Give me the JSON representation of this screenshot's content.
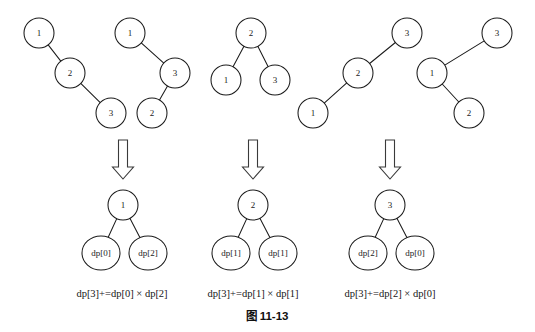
{
  "figure": {
    "caption": "图 11-13",
    "background_color": "#ffffff",
    "stroke_color": "#1b1b1b",
    "arrow_icon_name": "down-arrow-icon"
  },
  "top_trees": [
    {
      "id": "tree-1",
      "shape": "right-skewed-chain",
      "nodes": [
        {
          "label": "1",
          "cx": 39,
          "cy": 33,
          "r": 15
        },
        {
          "label": "2",
          "cx": 70,
          "cy": 73,
          "r": 15
        },
        {
          "label": "3",
          "cx": 111,
          "cy": 113,
          "r": 15
        }
      ],
      "edges": [
        [
          0,
          1
        ],
        [
          1,
          2
        ]
      ]
    },
    {
      "id": "tree-2",
      "shape": "zigzag-chain",
      "nodes": [
        {
          "label": "1",
          "cx": 130,
          "cy": 33,
          "r": 15
        },
        {
          "label": "3",
          "cx": 175,
          "cy": 73,
          "r": 15
        },
        {
          "label": "2",
          "cx": 152,
          "cy": 113,
          "r": 15
        }
      ],
      "edges": [
        [
          0,
          1
        ],
        [
          1,
          2
        ]
      ]
    },
    {
      "id": "tree-3",
      "shape": "balanced",
      "nodes": [
        {
          "label": "2",
          "cx": 251,
          "cy": 33,
          "r": 15
        },
        {
          "label": "1",
          "cx": 226,
          "cy": 80,
          "r": 15
        },
        {
          "label": "3",
          "cx": 275,
          "cy": 80,
          "r": 15
        }
      ],
      "edges": [
        [
          0,
          1
        ],
        [
          0,
          2
        ]
      ]
    },
    {
      "id": "tree-4",
      "shape": "left-skewed-chain",
      "nodes": [
        {
          "label": "3",
          "cx": 407,
          "cy": 33,
          "r": 15
        },
        {
          "label": "2",
          "cx": 358,
          "cy": 73,
          "r": 15
        },
        {
          "label": "1",
          "cx": 313,
          "cy": 113,
          "r": 15
        }
      ],
      "edges": [
        [
          0,
          1
        ],
        [
          1,
          2
        ]
      ]
    },
    {
      "id": "tree-5",
      "shape": "zigzag-chain",
      "nodes": [
        {
          "label": "3",
          "cx": 497,
          "cy": 33,
          "r": 15
        },
        {
          "label": "1",
          "cx": 432,
          "cy": 73,
          "r": 15
        },
        {
          "label": "2",
          "cx": 469,
          "cy": 113,
          "r": 15
        }
      ],
      "edges": [
        [
          0,
          1
        ],
        [
          1,
          2
        ]
      ]
    }
  ],
  "arrows": [
    {
      "id": "arrow-1",
      "x": 123,
      "top": 140,
      "bottom": 179
    },
    {
      "id": "arrow-2",
      "x": 253,
      "top": 140,
      "bottom": 179
    },
    {
      "id": "arrow-3",
      "x": 390,
      "top": 140,
      "bottom": 179
    }
  ],
  "result_groups": [
    {
      "id": "result-1",
      "root": {
        "label": "1",
        "cx": 123,
        "cy": 205,
        "r": 15
      },
      "children": [
        {
          "label": "dp[0]",
          "cx": 101,
          "cy": 253,
          "rx": 19,
          "ry": 17
        },
        {
          "label": "dp[2]",
          "cx": 148,
          "cy": 253,
          "rx": 19,
          "ry": 17
        }
      ],
      "formula": "dp[3]+=dp[0] × dp[2]",
      "formula_x": 122,
      "formula_y": 295
    },
    {
      "id": "result-2",
      "root": {
        "label": "2",
        "cx": 253,
        "cy": 205,
        "r": 15
      },
      "children": [
        {
          "label": "dp[1]",
          "cx": 231,
          "cy": 253,
          "rx": 19,
          "ry": 17
        },
        {
          "label": "dp[1]",
          "cx": 278,
          "cy": 253,
          "rx": 19,
          "ry": 17
        }
      ],
      "formula": "dp[3]+=dp[1] × dp[1]",
      "formula_x": 253,
      "formula_y": 295
    },
    {
      "id": "result-3",
      "root": {
        "label": "3",
        "cx": 390,
        "cy": 205,
        "r": 15
      },
      "children": [
        {
          "label": "dp[2]",
          "cx": 368,
          "cy": 253,
          "rx": 19,
          "ry": 17
        },
        {
          "label": "dp[0]",
          "cx": 415,
          "cy": 253,
          "rx": 19,
          "ry": 17
        }
      ],
      "formula": "dp[3]+=dp[2] × dp[0]",
      "formula_x": 390,
      "formula_y": 295
    }
  ],
  "caption_position": {
    "x": 267,
    "y": 317
  }
}
